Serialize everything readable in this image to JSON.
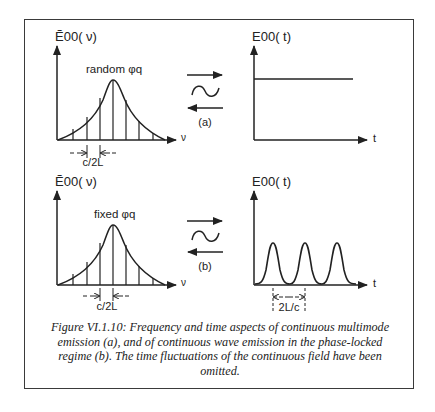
{
  "figure": {
    "panel_a": {
      "freq_axis_label": "Ẽ00( ν)",
      "freq_axis_x_label": "ν",
      "phase_label": "random φq",
      "spacing_label": "c/2L",
      "time_axis_label": "E00( t)",
      "time_axis_x_label": "t",
      "transform_tag": "(a)",
      "transform_symbol": "~"
    },
    "panel_b": {
      "freq_axis_label": "Ẽ00( ν)",
      "freq_axis_x_label": "ν",
      "phase_label": "fixed φq",
      "spacing_label": "c/2L",
      "time_axis_label": "E00( t)",
      "time_axis_x_label": "t",
      "transform_tag": "(b)",
      "transform_symbol": "~",
      "period_label": "2L/c"
    },
    "caption": "Figure VI.1.10: Frequency and time aspects of continuous multimode emission (a), and of continuous wave emission in the phase-locked regime (b). The time fluctuations of the continuous field have been omitted."
  },
  "colors": {
    "ink": "#222222",
    "frame": "#3a3a3a",
    "background": "#ffffff"
  }
}
